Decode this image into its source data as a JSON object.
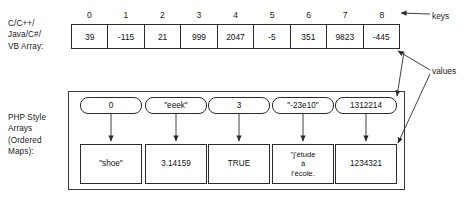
{
  "labels": {
    "c_array": "C/C++/\nJava/C#/\nVB Array:",
    "php_array": "PHP Style\nArrays\n(Ordered\nMaps):"
  },
  "annotations": {
    "keys": "keys",
    "values": "values"
  },
  "c_array": {
    "indices": [
      "0",
      "1",
      "2",
      "3",
      "4",
      "5",
      "6",
      "7",
      "8"
    ],
    "values": [
      "39",
      "-115",
      "21",
      "999",
      "2047",
      "-5",
      "351",
      "9823",
      "-445"
    ]
  },
  "php_array": {
    "keys": [
      "0",
      "\"eeek\"",
      "3",
      "\"-23e10\"",
      "1312214"
    ],
    "values": [
      "\"shoe\"",
      "3.14159",
      "TRUE",
      "\"j'étude\nà\nl'école.",
      "1234321"
    ]
  },
  "colors": {
    "stroke": "#2b2b2b",
    "text": "#111111",
    "background": "#ffffff"
  }
}
